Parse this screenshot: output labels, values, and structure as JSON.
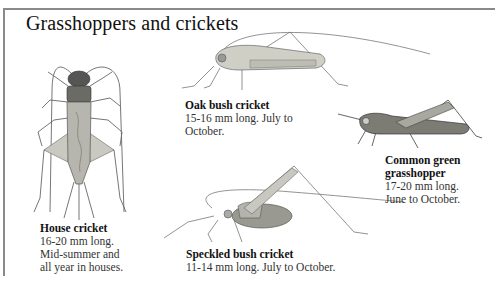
{
  "page": {
    "title": "Grasshoppers and crickets"
  },
  "species": [
    {
      "name": "House cricket",
      "desc_lines": [
        "16-20 mm long.",
        "Mid-summer and",
        "all year in houses."
      ],
      "desc": "16-20 mm long. Mid-summer and all year in houses.",
      "icon": "house-cricket-illustration"
    },
    {
      "name": "Oak bush cricket",
      "desc_lines": [
        "15-16 mm long. July to",
        "October."
      ],
      "desc": "15-16 mm long. July to October.",
      "icon": "oak-bush-cricket-illustration"
    },
    {
      "name_lines": [
        "Common green",
        "grasshopper"
      ],
      "name": "Common green grasshopper",
      "desc_lines": [
        "17-20 mm long.",
        "June to October."
      ],
      "desc": "17-20 mm long. June to October.",
      "icon": "common-green-grasshopper-illustration"
    },
    {
      "name": "Speckled bush cricket",
      "desc_lines": [
        "11-14 mm long. July to October."
      ],
      "desc": "11-14 mm long. July to October.",
      "icon": "speckled-bush-cricket-illustration"
    }
  ],
  "colors": {
    "frame": "#8a8a8a",
    "text": "#333333",
    "heading": "#111111",
    "insect_fill": "#b8b8b0",
    "insect_stroke": "#555555"
  }
}
